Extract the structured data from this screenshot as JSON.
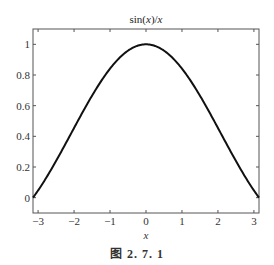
{
  "chart_data": {
    "type": "line",
    "title": "sin(x)/x",
    "xlabel": "x",
    "ylabel": "",
    "xlim": [
      -3.14159,
      3.14159
    ],
    "ylim": [
      -0.1,
      1.1
    ],
    "xticks": [
      -3,
      -2,
      -1,
      0,
      1,
      2,
      3
    ],
    "xtick_labels": [
      "−3",
      "−2",
      "−1",
      "0",
      "1",
      "2",
      "3"
    ],
    "yticks": [
      0,
      0.2,
      0.4,
      0.6,
      0.8,
      1
    ],
    "ytick_labels": [
      "0",
      "0.2",
      "0.4",
      "0.6",
      "0.8",
      "1"
    ],
    "grid": false,
    "legend": null,
    "series": [
      {
        "name": "sin(x)/x",
        "function": "sin(x)/x",
        "x": [
          -3.1416,
          -2.5,
          -2.0,
          -1.5,
          -1.0,
          -0.5,
          0,
          0.5,
          1.0,
          1.5,
          2.0,
          2.5,
          3.1416
        ],
        "values": [
          0.0,
          0.2394,
          0.4546,
          0.665,
          0.8415,
          0.9589,
          1.0,
          0.9589,
          0.8415,
          0.665,
          0.4546,
          0.2394,
          0.0
        ]
      }
    ]
  },
  "caption": "图 2. 7. 1"
}
